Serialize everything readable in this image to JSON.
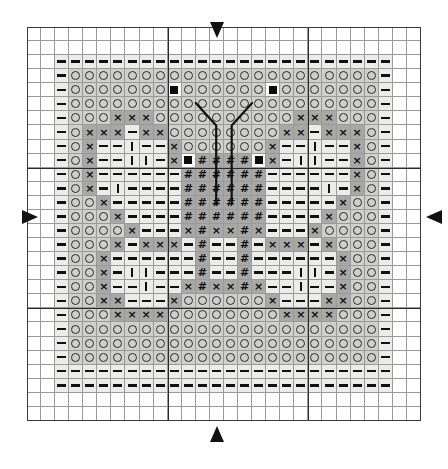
{
  "chart_data": {
    "type": "heatmap",
    "grid_cols": 28,
    "grid_rows": 28,
    "cell_px": 14.07,
    "heavy_line_every": 10,
    "legend_symbols": [
      {
        "key": "dash",
        "glyph": "—",
        "name": "half-tone-dash"
      },
      {
        "key": "circle",
        "glyph": "○",
        "name": "open-circle"
      },
      {
        "key": "cross",
        "glyph": "×",
        "name": "cross-x"
      },
      {
        "key": "bar",
        "glyph": "|",
        "name": "vertical-bar"
      },
      {
        "key": "hash",
        "glyph": "#",
        "name": "hash"
      },
      {
        "key": "square",
        "glyph": "■",
        "name": "filled-square"
      }
    ],
    "shades": {
      "blank": "#ffffff",
      "light": "#ececeb",
      "mid": "#cfcfce",
      "dark": "#a8a8a7",
      "white": "#fbfbfb"
    },
    "symbol_rows": [
      "............................",
      "............................",
      "..------------------------..",
      "..-oooooooooooooooooooooo-..",
      "..-oooooooo#ooo#oooooooooo-.",
      "..-oooooooooooooooooooooo-..",
      "..-ooxxxoooooooooxxxooo-...",
      "..-oxxx-xxoooooxx-xxxo-....",
      "..-ox--|--xoooox--|--xo-...",
      "..-ox-||--x#s#x--||-xo-....",
      "..-ox-------###-------xo-..",
      "..-ox-|-----###-----|-xo-..",
      "..-oox------###------xoo-..",
      "..-ooox-----###-----xooo-..",
      "..-oooox----x#x----xoooo-..",
      "..-ooox-xxx-#-xxx-xooo-....",
      "..-oox-------#-------xoo-..",
      "..-oox-||----#----||-xoo-..",
      "..-oox--|--x#x--|--xoo-....",
      "..-ooxx---xooox---xxoo-....",
      "..-oooxxxxooooooxxxxooo-...",
      "..-oooooooooooooooooooooo-..",
      "..------------------------..",
      "............................",
      "............................"
    ],
    "rows": [
      {
        "i": 0,
        "cells": "............................"
      },
      {
        "i": 1,
        "cells": "............................"
      },
      {
        "i": 2,
        "cells": "..------------------------.."
      },
      {
        "i": 3,
        "cells": "..-OOOOOOOOOOOOOOOOOOOOOO-.."
      },
      {
        "i": 4,
        "cells": "..-OOOOOOO#OOO#OOOOOOOOOO-.."
      },
      {
        "i": 5,
        "cells": "..-OOOOOOOOOOOOOOOOOOOOOO-.."
      },
      {
        "i": 6,
        "cells": "..-OOXXXOOOOOOOOOOXXXOOO-.."
      },
      {
        "i": 7,
        "cells": "..-OXXX-XXOOOOXX-XXXO-....."
      },
      {
        "i": 8,
        "cells": "..-OX--|--XOOOX--|--XO-...."
      },
      {
        "i": 9,
        "cells": "..-OX-||--XSHSX--||-XO-...."
      },
      {
        "i": 10,
        "cells": "..-OX-------HHH-------XO-..."
      },
      {
        "i": 11,
        "cells": "..-OX-|-----HHH-----|-XO-..."
      },
      {
        "i": 12,
        "cells": "..-OOX------HHH------XOO-..."
      },
      {
        "i": 13,
        "cells": "..-OOOX-----HHH-----XOOO-.."
      },
      {
        "i": 14,
        "cells": "..-OOOOX----XHX----XOOOO-.."
      },
      {
        "i": 15,
        "cells": "..-OOOX-XXX-H-XXX-XOOO-...."
      },
      {
        "i": 16,
        "cells": "..-OOX-------H-------XOO-..."
      },
      {
        "i": 17,
        "cells": "..-OOX-||----H----||-XOO-..."
      },
      {
        "i": 18,
        "cells": "..-OOX--|--XHX--|--XOO-...."
      },
      {
        "i": 19,
        "cells": "..-OOXX---XOOOX---XXOO-...."
      },
      {
        "i": 20,
        "cells": "..-OOOXXXXOOOOOOXXXXOOO-..."
      },
      {
        "i": 21,
        "cells": "..-OOOOOOOOOOOOOOOOOOOOOO-.."
      },
      {
        "i": 22,
        "cells": "..------------------------.."
      },
      {
        "i": 23,
        "cells": "............................"
      },
      {
        "i": 24,
        "cells": "............................"
      }
    ],
    "arrows": [
      {
        "name": "centre-marker-top",
        "side": "top",
        "direction": "down",
        "col": 13.5
      },
      {
        "name": "centre-marker-bottom",
        "side": "bottom",
        "direction": "up",
        "col": 13.5
      },
      {
        "name": "centre-marker-left",
        "side": "left",
        "direction": "right",
        "row": 13.5
      },
      {
        "name": "centre-marker-right",
        "side": "right",
        "direction": "left",
        "row": 13.5
      }
    ],
    "backstitch": {
      "name": "antennae-backstitch",
      "color": "#111111",
      "width_px": 2.2,
      "paths": [
        [
          [
            12.0,
            5.4
          ],
          [
            13.45,
            7.0
          ],
          [
            13.45,
            12.6
          ]
        ],
        [
          [
            16.0,
            5.4
          ],
          [
            14.55,
            7.0
          ],
          [
            14.55,
            12.6
          ]
        ]
      ]
    },
    "notes": {
      "axis_labels_visible": false,
      "legend_visible": false,
      "page_numbers_visible": false
    }
  }
}
